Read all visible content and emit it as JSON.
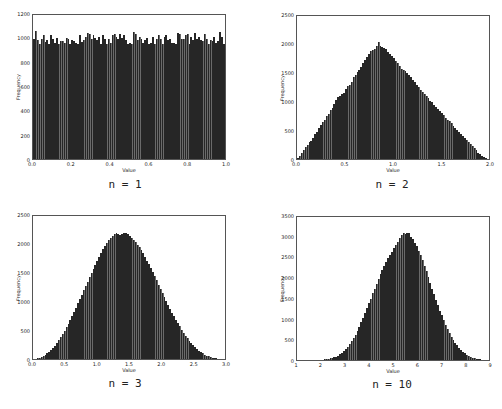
{
  "chart_data": [
    {
      "type": "bar",
      "title": "",
      "caption": "n = 1",
      "xlabel": "Value",
      "ylabel": "Frequency",
      "xlim": [
        0.0,
        1.0
      ],
      "ylim": [
        0,
        1200
      ],
      "xticks": [
        "0.0",
        "0.2",
        "0.4",
        "0.6",
        "0.8",
        "1.0"
      ],
      "yticks": [
        "0",
        "200",
        "400",
        "600",
        "800",
        "1000",
        "1200"
      ],
      "grid": false,
      "bins": 100,
      "values": [
        1000,
        1065,
        990,
        960,
        1000,
        1030,
        975,
        990,
        960,
        1030,
        1000,
        970,
        1010,
        960,
        980,
        985,
        970,
        1010,
        1000,
        960,
        990,
        980,
        970,
        960,
        1030,
        975,
        990,
        1020,
        1050,
        1040,
        1000,
        1030,
        1010,
        990,
        1020,
        960,
        1030,
        1000,
        960,
        1000,
        970,
        1030,
        1040,
        1020,
        1000,
        1040,
        1010,
        1030,
        990,
        960,
        970,
        960,
        1060,
        1040,
        990,
        1020,
        1000,
        970,
        990,
        1010,
        960,
        970,
        1020,
        960,
        1000,
        1030,
        1000,
        960,
        1020,
        1030,
        990,
        1000,
        970,
        970,
        960,
        1050,
        1040,
        1000,
        1000,
        1030,
        1040,
        960,
        1020,
        990,
        1050,
        1000,
        1020,
        990,
        980,
        1040,
        1000,
        960,
        990,
        980,
        1020,
        970,
        980,
        1060,
        1020,
        960
      ]
    },
    {
      "type": "bar",
      "title": "",
      "caption": "n = 2",
      "xlabel": "Value",
      "ylabel": "Frequency",
      "xlim": [
        0.0,
        2.0
      ],
      "ylim": [
        0,
        2500
      ],
      "xticks": [
        "0.0",
        "0.5",
        "1.0",
        "1.5",
        "2.0"
      ],
      "yticks": [
        "0",
        "500",
        "1000",
        "1500",
        "2000",
        "2500"
      ],
      "grid": false,
      "bins": 100,
      "values": [
        20,
        60,
        100,
        150,
        210,
        250,
        300,
        320,
        360,
        430,
        480,
        540,
        590,
        640,
        680,
        760,
        780,
        850,
        890,
        960,
        1040,
        1080,
        1100,
        1140,
        1160,
        1230,
        1270,
        1300,
        1350,
        1430,
        1470,
        1520,
        1560,
        1600,
        1680,
        1730,
        1780,
        1830,
        1880,
        1910,
        1920,
        1980,
        2050,
        1980,
        1960,
        1940,
        1920,
        1870,
        1830,
        1800,
        1760,
        1720,
        1680,
        1620,
        1580,
        1560,
        1530,
        1500,
        1460,
        1440,
        1380,
        1340,
        1300,
        1260,
        1200,
        1180,
        1140,
        1110,
        1060,
        1020,
        990,
        950,
        910,
        880,
        840,
        800,
        770,
        720,
        690,
        660,
        630,
        580,
        550,
        510,
        470,
        440,
        400,
        370,
        330,
        290,
        260,
        220,
        190,
        150,
        110,
        80,
        50,
        30,
        10,
        0
      ]
    },
    {
      "type": "bar",
      "title": "",
      "caption": "n = 3",
      "xlabel": "Value",
      "ylabel": "Frequency",
      "xlim": [
        0.0,
        3.0
      ],
      "ylim": [
        0,
        2500
      ],
      "xticks": [
        "0.0",
        "0.5",
        "1.0",
        "1.5",
        "2.0",
        "2.5",
        "3.0"
      ],
      "yticks": [
        "0",
        "500",
        "1000",
        "1500",
        "2000",
        "2500"
      ],
      "grid": false,
      "bins": 100,
      "values": [
        2,
        6,
        14,
        24,
        38,
        55,
        75,
        100,
        128,
        160,
        195,
        235,
        280,
        330,
        380,
        435,
        495,
        560,
        620,
        690,
        760,
        830,
        900,
        975,
        1050,
        1120,
        1200,
        1275,
        1350,
        1430,
        1500,
        1570,
        1650,
        1720,
        1790,
        1860,
        1920,
        1980,
        2030,
        2080,
        2110,
        2150,
        2180,
        2200,
        2180,
        2160,
        2190,
        2210,
        2200,
        2180,
        2150,
        2120,
        2080,
        2040,
        2000,
        1960,
        1900,
        1850,
        1790,
        1720,
        1660,
        1590,
        1520,
        1450,
        1380,
        1300,
        1230,
        1160,
        1090,
        1020,
        950,
        880,
        810,
        750,
        690,
        630,
        570,
        510,
        460,
        410,
        360,
        315,
        275,
        240,
        205,
        175,
        145,
        120,
        98,
        78,
        60,
        45,
        33,
        23,
        15,
        9,
        5,
        3,
        1,
        0
      ]
    },
    {
      "type": "bar",
      "title": "",
      "caption": "n = 10",
      "xlabel": "Value",
      "ylabel": "Frequency",
      "xlim": [
        1,
        9
      ],
      "ylim": [
        0,
        3500
      ],
      "xticks": [
        "1",
        "2",
        "3",
        "4",
        "5",
        "6",
        "7",
        "8",
        "9"
      ],
      "yticks": [
        "0",
        "500",
        "1000",
        "1500",
        "2000",
        "2500",
        "3000",
        "3500"
      ],
      "grid": false,
      "bins": 100,
      "values": [
        0,
        0,
        0,
        0,
        0,
        0,
        0,
        0,
        1,
        2,
        3,
        5,
        7,
        10,
        14,
        20,
        28,
        38,
        50,
        66,
        85,
        110,
        140,
        175,
        215,
        265,
        320,
        385,
        455,
        535,
        620,
        715,
        815,
        920,
        1030,
        1145,
        1265,
        1385,
        1505,
        1630,
        1750,
        1870,
        1990,
        2105,
        2210,
        2310,
        2400,
        2490,
        2570,
        2650,
        2730,
        2820,
        2900,
        2980,
        3050,
        3110,
        3080,
        3120,
        3100,
        3020,
        2950,
        2870,
        2780,
        2680,
        2560,
        2440,
        2310,
        2170,
        2030,
        1890,
        1750,
        1610,
        1470,
        1340,
        1210,
        1090,
        970,
        860,
        760,
        665,
        575,
        495,
        420,
        355,
        295,
        245,
        200,
        160,
        128,
        100,
        78,
        60,
        45,
        33,
        24,
        17,
        11,
        7,
        4,
        2
      ]
    }
  ]
}
